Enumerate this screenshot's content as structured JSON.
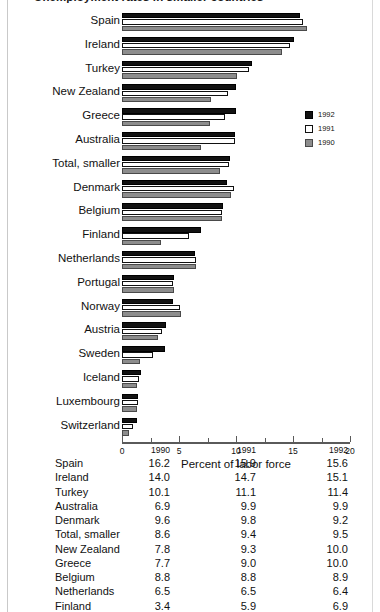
{
  "page": {
    "title_fragment": "Unemployment rates in smaller countries"
  },
  "chart_data": {
    "type": "bar",
    "orientation": "horizontal",
    "title": "Unemployment rates in smaller countries",
    "xlabel": "Percent of labor force",
    "ylabel": "",
    "xlim": [
      0,
      20
    ],
    "xticks": [
      0,
      5,
      10,
      15,
      20
    ],
    "xtick_labels": [
      "0",
      "5",
      "10",
      "15",
      "20"
    ],
    "minor_ticks": [
      2.5,
      7.5,
      12.5,
      17.5
    ],
    "grid": false,
    "legend_position": "right",
    "legend": [
      {
        "name": "1992",
        "color": "#121212"
      },
      {
        "name": "1991",
        "color": "#ffffff"
      },
      {
        "name": "1990",
        "color": "#8d8d8d"
      }
    ],
    "categories": [
      "Spain",
      "Ireland",
      "Turkey",
      "New Zealand",
      "Greece",
      "Australia",
      "Total, smaller",
      "Denmark",
      "Belgium",
      "Finland",
      "Netherlands",
      "Portugal",
      "Norway",
      "Austria",
      "Sweden",
      "Iceland",
      "Luxembourg",
      "Switzerland"
    ],
    "series": [
      {
        "name": "1992",
        "color": "#121212",
        "values": [
          15.6,
          15.1,
          11.4,
          10.0,
          10.0,
          9.9,
          9.5,
          9.2,
          8.9,
          6.9,
          6.4,
          4.6,
          4.5,
          3.9,
          3.8,
          1.7,
          1.4,
          1.3
        ]
      },
      {
        "name": "1991",
        "color": "#ffffff",
        "values": [
          15.9,
          14.7,
          11.1,
          9.3,
          9.0,
          9.9,
          9.4,
          9.8,
          8.8,
          5.9,
          6.5,
          4.5,
          5.1,
          3.5,
          2.7,
          1.5,
          1.4,
          1.0
        ]
      },
      {
        "name": "1990",
        "color": "#8d8d8d",
        "values": [
          16.2,
          14.0,
          10.1,
          7.8,
          7.7,
          6.9,
          8.6,
          9.6,
          8.8,
          3.4,
          6.5,
          4.6,
          5.2,
          3.2,
          1.6,
          1.3,
          1.3,
          0.6
        ]
      }
    ]
  },
  "table": {
    "columns": [
      "",
      "1990",
      "1991",
      "1992"
    ],
    "rows": [
      {
        "name": "Spain",
        "v1990": "16.2",
        "v1991": "15.9",
        "v1992": "15.6"
      },
      {
        "name": "Ireland",
        "v1990": "14.0",
        "v1991": "14.7",
        "v1992": "15.1"
      },
      {
        "name": "Turkey",
        "v1990": "10.1",
        "v1991": "11.1",
        "v1992": "11.4"
      },
      {
        "name": "Australia",
        "v1990": "6.9",
        "v1991": "9.9",
        "v1992": "9.9"
      },
      {
        "name": "Denmark",
        "v1990": "9.6",
        "v1991": "9.8",
        "v1992": "9.2"
      },
      {
        "name": "Total, smaller",
        "v1990": "8.6",
        "v1991": "9.4",
        "v1992": "9.5"
      },
      {
        "name": "New Zealand",
        "v1990": "7.8",
        "v1991": "9.3",
        "v1992": "10.0"
      },
      {
        "name": "Greece",
        "v1990": "7.7",
        "v1991": "9.0",
        "v1992": "10.0"
      },
      {
        "name": "Belgium",
        "v1990": "8.8",
        "v1991": "8.8",
        "v1992": "8.9"
      },
      {
        "name": "Netherlands",
        "v1990": "6.5",
        "v1991": "6.5",
        "v1992": "6.4"
      },
      {
        "name": "Finland",
        "v1990": "3.4",
        "v1991": "5.9",
        "v1992": "6.9"
      },
      {
        "name": "Norway",
        "v1990": "5.2",
        "v1991": "5.1",
        "v1992": "4.5"
      },
      {
        "name": "Portugal",
        "v1990": "4.6",
        "v1991": "4.5",
        "v1992": "4.6"
      }
    ]
  }
}
